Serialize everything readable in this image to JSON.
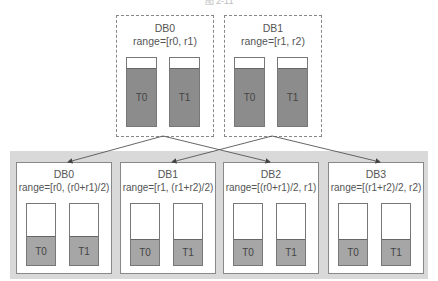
{
  "caption": "图 2-11",
  "source_dbs": [
    {
      "name": "DB0",
      "range": "range=[r0, r1)",
      "tables": [
        "T0",
        "T1"
      ]
    },
    {
      "name": "DB1",
      "range": "range=[r1, r2)",
      "tables": [
        "T0",
        "T1"
      ]
    }
  ],
  "target_dbs": [
    {
      "name": "DB0",
      "range": "range=[r0, (r0+r1)/2)",
      "tables": [
        "T0",
        "T1"
      ]
    },
    {
      "name": "DB1",
      "range": "range=[r1, (r1+r2)/2)",
      "tables": [
        "T0",
        "T1"
      ]
    },
    {
      "name": "DB2",
      "range": "range=[(r0+r1)/2, r1)",
      "tables": [
        "T0",
        "T1"
      ]
    },
    {
      "name": "DB3",
      "range": "range=[(r1+r2)/2, r2)",
      "tables": [
        "T0",
        "T1"
      ]
    }
  ],
  "colors": {
    "table_fill_source": "#8c8c8c",
    "table_fill_target": "#a6a6a6",
    "band": "#d9d9d9"
  }
}
